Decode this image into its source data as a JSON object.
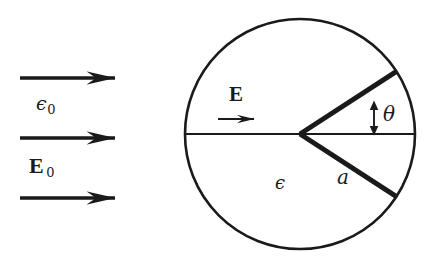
{
  "figure": {
    "type": "physics-diagram",
    "background_color": "#ffffff",
    "ink_color": "#1a1a1a",
    "width": 435,
    "height": 262
  },
  "external_field": {
    "medium_label": "ϵ",
    "medium_subscript": "0",
    "field_label": "E",
    "field_subscript": "0",
    "arrows": [
      {
        "name": "field-arrow-top",
        "x1": 20,
        "y1": 78,
        "x2": 125,
        "y2": 78
      },
      {
        "name": "field-arrow-middle",
        "x1": 20,
        "y1": 138,
        "x2": 125,
        "y2": 138
      },
      {
        "name": "field-arrow-bottom",
        "x1": 20,
        "y1": 198,
        "x2": 125,
        "y2": 198
      }
    ],
    "direction": "right"
  },
  "sphere": {
    "center_x": 300,
    "center_y": 134,
    "radius": 115,
    "stroke_width": 2.6,
    "medium_label": "ϵ",
    "radius_label": "a",
    "angle_label": "θ",
    "inner_field_label": "E",
    "diameter": {
      "x1": 186,
      "y1": 134,
      "x2": 415,
      "y2": 134
    },
    "wedge": {
      "upper_radius_angle_deg": 33,
      "lower_radius_angle_deg": -33,
      "upper_end_x": 388,
      "upper_end_y": 71,
      "lower_end_x": 388,
      "lower_end_y": 197,
      "stroke_width": 5
    },
    "inner_arrow": {
      "x1": 218,
      "y1": 119,
      "x2": 270,
      "y2": 119
    },
    "theta_marker": {
      "x": 374,
      "y_top": 102,
      "y_bottom": 134
    }
  }
}
